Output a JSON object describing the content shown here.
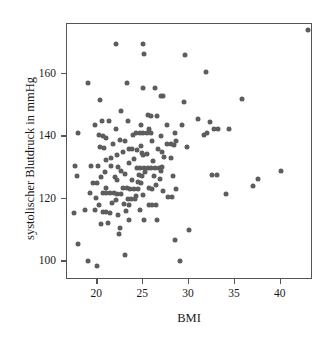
{
  "chart_data": {
    "type": "scatter",
    "title": "",
    "xlabel": "BMI",
    "ylabel": "systolischer Blutdruck in mmHg",
    "xlim": [
      16.7,
      43.5
    ],
    "ylim": [
      94,
      176
    ],
    "xticks": [
      20,
      25,
      30,
      35,
      40
    ],
    "yticks": [
      100,
      120,
      140,
      160
    ],
    "grid": false,
    "legend": null,
    "marker_color": "#5d5d5d",
    "marker_size": 5,
    "n_points": 171,
    "series": [
      {
        "name": "Patienten",
        "points": [
          [
            43.0,
            174.0
          ],
          [
            22.0,
            169.5
          ],
          [
            25.0,
            169.5
          ],
          [
            25.1,
            166.5
          ],
          [
            29.6,
            166.0
          ],
          [
            31.8,
            160.5
          ],
          [
            19.0,
            157.0
          ],
          [
            23.2,
            157.0
          ],
          [
            25.0,
            155.5
          ],
          [
            26.3,
            155.5
          ],
          [
            20.3,
            151.5
          ],
          [
            26.9,
            153.0
          ],
          [
            27.2,
            153.0
          ],
          [
            29.5,
            151.0
          ],
          [
            35.8,
            152.0
          ],
          [
            22.6,
            148.0
          ],
          [
            20.5,
            145.0
          ],
          [
            23.3,
            145.0
          ],
          [
            25.5,
            147.0
          ],
          [
            25.9,
            146.5
          ],
          [
            26.5,
            146.5
          ],
          [
            31.0,
            145.5
          ],
          [
            32.3,
            144.5
          ],
          [
            19.8,
            143.5
          ],
          [
            27.6,
            143.5
          ],
          [
            29.2,
            143.8
          ],
          [
            32.7,
            142.5
          ],
          [
            33.1,
            142.5
          ],
          [
            34.3,
            142.5
          ],
          [
            17.9,
            141.0
          ],
          [
            20.2,
            140.3
          ],
          [
            20.6,
            140.0
          ],
          [
            21.0,
            139.5
          ],
          [
            24.2,
            141.0
          ],
          [
            24.6,
            141.0
          ],
          [
            25.0,
            141.0
          ],
          [
            25.4,
            141.0
          ],
          [
            25.8,
            141.0
          ],
          [
            31.6,
            140.5
          ],
          [
            32.0,
            141.0
          ],
          [
            22.5,
            139.0
          ],
          [
            23.0,
            138.5
          ],
          [
            26.0,
            138.5
          ],
          [
            27.6,
            137.5
          ],
          [
            28.0,
            137.5
          ],
          [
            28.4,
            137.3
          ],
          [
            28.6,
            138.5
          ],
          [
            20.3,
            136.5
          ],
          [
            20.7,
            136.3
          ],
          [
            23.4,
            136.0
          ],
          [
            23.8,
            136.0
          ],
          [
            24.3,
            135.5
          ],
          [
            26.6,
            136.0
          ],
          [
            29.8,
            136.5
          ],
          [
            22.1,
            134.0
          ],
          [
            25.0,
            134.0
          ],
          [
            25.4,
            134.2
          ],
          [
            21.5,
            133.0
          ],
          [
            24.0,
            132.8
          ],
          [
            27.3,
            133.5
          ],
          [
            28.0,
            133.0
          ],
          [
            19.3,
            130.5
          ],
          [
            20.1,
            130.5
          ],
          [
            21.5,
            130.5
          ],
          [
            22.3,
            130.3
          ],
          [
            24.3,
            130.0
          ],
          [
            24.7,
            130.0
          ],
          [
            25.1,
            130.0
          ],
          [
            25.5,
            130.0
          ],
          [
            25.9,
            130.0
          ],
          [
            26.3,
            130.0
          ],
          [
            26.7,
            130.0
          ],
          [
            27.1,
            130.2
          ],
          [
            17.6,
            130.5
          ],
          [
            33.0,
            127.5
          ],
          [
            32.5,
            127.5
          ],
          [
            37.5,
            126.5
          ],
          [
            40.0,
            129.0
          ],
          [
            17.8,
            127.3
          ],
          [
            23.0,
            128.0
          ],
          [
            24.5,
            127.5
          ],
          [
            24.9,
            127.2
          ],
          [
            26.2,
            127.3
          ],
          [
            28.3,
            127.3
          ],
          [
            22.2,
            126.0
          ],
          [
            24.4,
            125.5
          ],
          [
            24.8,
            125.2
          ],
          [
            19.5,
            125.0
          ],
          [
            20.0,
            125.0
          ],
          [
            37.0,
            124.0
          ],
          [
            21.0,
            123.5
          ],
          [
            22.8,
            123.5
          ],
          [
            23.2,
            123.5
          ],
          [
            23.6,
            123.3
          ],
          [
            24.0,
            123.3
          ],
          [
            24.4,
            123.3
          ],
          [
            25.6,
            123.5
          ],
          [
            26.0,
            123.0
          ],
          [
            28.6,
            123.0
          ],
          [
            20.6,
            122.0
          ],
          [
            21.0,
            122.0
          ],
          [
            21.4,
            121.8
          ],
          [
            21.8,
            121.8
          ],
          [
            22.2,
            121.5
          ],
          [
            22.6,
            121.5
          ],
          [
            34.0,
            121.5
          ],
          [
            19.9,
            120.3
          ],
          [
            23.3,
            120.0
          ],
          [
            23.7,
            119.8
          ],
          [
            24.1,
            119.8
          ],
          [
            27.7,
            120.5
          ],
          [
            28.1,
            120.5
          ],
          [
            20.2,
            118.0
          ],
          [
            22.9,
            118.5
          ],
          [
            23.4,
            118.0
          ],
          [
            25.6,
            118.0
          ],
          [
            26.0,
            118.0
          ],
          [
            26.4,
            118.0
          ],
          [
            17.5,
            115.5
          ],
          [
            18.7,
            116.5
          ],
          [
            19.8,
            116.3
          ],
          [
            20.6,
            115.8
          ],
          [
            21.0,
            115.8
          ],
          [
            21.4,
            115.5
          ],
          [
            22.3,
            114.8
          ],
          [
            23.5,
            113.3
          ],
          [
            25.1,
            113.3
          ],
          [
            26.5,
            113.3
          ],
          [
            20.4,
            111.8
          ],
          [
            21.2,
            112.3
          ],
          [
            22.5,
            110.8
          ],
          [
            30.0,
            110.0
          ],
          [
            22.4,
            108.8
          ],
          [
            28.5,
            106.8
          ],
          [
            17.9,
            105.5
          ],
          [
            23.0,
            102.0
          ],
          [
            19.0,
            100.0
          ],
          [
            29.0,
            100.0
          ],
          [
            20.0,
            98.5
          ],
          [
            21.3,
            144.8
          ],
          [
            24.8,
            143.5
          ],
          [
            25.6,
            142.5
          ],
          [
            28.5,
            141.0
          ],
          [
            22.0,
            142.5
          ],
          [
            23.9,
            140.5
          ],
          [
            26.9,
            140.0
          ],
          [
            21.7,
            137.5
          ],
          [
            22.8,
            135.0
          ],
          [
            24.8,
            137.0
          ],
          [
            27.0,
            135.0
          ],
          [
            20.9,
            132.5
          ],
          [
            23.5,
            131.5
          ],
          [
            26.1,
            132.0
          ],
          [
            22.6,
            129.0
          ],
          [
            25.2,
            128.5
          ],
          [
            21.9,
            127.0
          ],
          [
            23.8,
            126.0
          ],
          [
            26.8,
            126.5
          ],
          [
            20.8,
            128.5
          ],
          [
            24.2,
            121.0
          ],
          [
            25.0,
            121.3
          ],
          [
            27.2,
            122.5
          ],
          [
            22.0,
            119.5
          ],
          [
            24.6,
            116.5
          ],
          [
            21.6,
            118.8
          ],
          [
            26.9,
            129.0
          ],
          [
            19.2,
            122.0
          ],
          [
            23.1,
            116.0
          ],
          [
            24.9,
            134.8
          ],
          [
            26.4,
            124.5
          ],
          [
            20.4,
            127.0
          ]
        ]
      }
    ]
  },
  "axes": {
    "x_title": "BMI",
    "y_title": "systolischer Blutdruck in mmHg",
    "x_tick_labels": [
      "20",
      "25",
      "30",
      "35",
      "40"
    ],
    "y_tick_labels": [
      "100",
      "120",
      "140",
      "160"
    ]
  }
}
